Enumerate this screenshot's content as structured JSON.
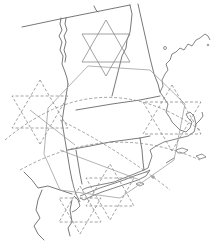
{
  "map": {
    "width": 215,
    "height": 243,
    "background": "#ffffff",
    "line_color": "#555555",
    "overlay_color": "#8a8a8a",
    "region": "Northeastern United States",
    "states_outlined": [
      "Vermont",
      "New Hampshire",
      "Massachusetts",
      "Connecticut",
      "Rhode Island",
      "New York",
      "New Jersey"
    ],
    "overlays": {
      "solid_hexagram": {
        "cx": 106,
        "cy": 48,
        "r": 28,
        "style": "solid"
      },
      "dashed_hexagrams": [
        {
          "name": "west",
          "cx": 40,
          "cy": 112,
          "r": 32,
          "style": "dashed"
        },
        {
          "name": "east",
          "cx": 172,
          "cy": 118,
          "r": 33,
          "style": "dashed"
        },
        {
          "name": "south-center",
          "cx": 110,
          "cy": 192,
          "r": 28,
          "style": "dashed"
        },
        {
          "name": "south-west",
          "cx": 80,
          "cy": 210,
          "r": 24,
          "style": "dashed"
        }
      ],
      "solid_hexagon": {
        "cx": 115,
        "cy": 140,
        "r": 80,
        "style": "solid"
      }
    }
  }
}
